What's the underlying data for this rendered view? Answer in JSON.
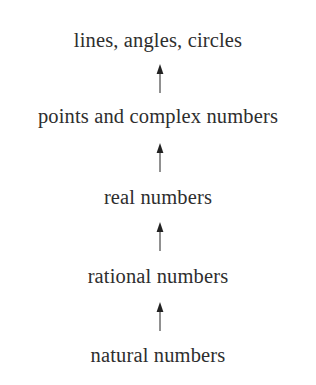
{
  "diagram": {
    "type": "hierarchy",
    "direction": "bottom-to-top",
    "nodes": [
      {
        "id": "lines",
        "label": "lines, angles, circles"
      },
      {
        "id": "points",
        "label": "points and complex numbers"
      },
      {
        "id": "real",
        "label": "real numbers"
      },
      {
        "id": "rational",
        "label": "rational numbers"
      },
      {
        "id": "natural",
        "label": "natural numbers"
      }
    ],
    "edges": [
      {
        "from": "points",
        "to": "lines"
      },
      {
        "from": "real",
        "to": "points"
      },
      {
        "from": "rational",
        "to": "real"
      },
      {
        "from": "natural",
        "to": "rational"
      }
    ],
    "colors": {
      "text": "#2e2e2e",
      "arrow": "#222222",
      "background": "#ffffff"
    }
  }
}
